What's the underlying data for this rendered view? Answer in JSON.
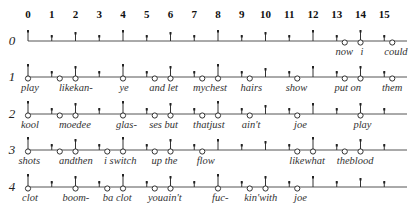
{
  "diagram": {
    "type": "rhythm-grid",
    "beats_per_row": 16,
    "column_labels": [
      "0",
      "1",
      "2",
      "3",
      "4",
      "5",
      "6",
      "7",
      "8",
      "9",
      "10",
      "11",
      "12",
      "13",
      "14",
      "15"
    ],
    "rows": [
      {
        "label": "0",
        "notes": [
          13.33,
          14,
          15.33
        ],
        "lyrics": [
          {
            "text": "now",
            "at": 12.95
          },
          {
            "text": "i",
            "at": 14.0
          },
          {
            "text": "could",
            "at": 15.0
          }
        ]
      },
      {
        "label": "1",
        "notes": [
          0,
          1.33,
          2,
          4,
          5.33,
          6,
          7.33,
          8,
          9.33,
          11.33,
          13.33,
          14,
          15.33
        ],
        "lyrics": [
          {
            "text": "play",
            "at": -0.3
          },
          {
            "text": "likekan-",
            "at": 1.3
          },
          {
            "text": "ye",
            "at": 3.85
          },
          {
            "text": "and let",
            "at": 5.1
          },
          {
            "text": "mychest",
            "at": 6.95
          },
          {
            "text": "hairs",
            "at": 8.95
          },
          {
            "text": "show",
            "at": 10.85
          },
          {
            "text": "put on",
            "at": 12.9
          },
          {
            "text": "them",
            "at": 14.9
          }
        ]
      },
      {
        "label": "2",
        "notes": [
          0,
          1.33,
          2,
          4,
          5.33,
          6,
          7.33,
          8,
          9.33,
          11.33,
          14
        ],
        "lyrics": [
          {
            "text": "kool",
            "at": -0.3
          },
          {
            "text": "moedee",
            "at": 1.3
          },
          {
            "text": "glas-",
            "at": 3.7
          },
          {
            "text": "ses but",
            "at": 5.1
          },
          {
            "text": "thatjust",
            "at": 6.95
          },
          {
            "text": "ain't",
            "at": 9.0
          },
          {
            "text": "joe",
            "at": 11.2
          },
          {
            "text": "play",
            "at": 13.7
          }
        ]
      },
      {
        "label": "3",
        "notes": [
          0,
          1.33,
          2,
          3.33,
          4,
          5.33,
          6,
          7.33,
          11.33,
          12,
          13.33,
          14
        ],
        "lyrics": [
          {
            "text": "shots",
            "at": -0.4
          },
          {
            "text": "andthen",
            "at": 1.3
          },
          {
            "text": "i switch",
            "at": 3.2
          },
          {
            "text": "up the",
            "at": 5.2
          },
          {
            "text": "flow",
            "at": 7.1
          },
          {
            "text": "likewhat",
            "at": 11.0
          },
          {
            "text": "theblood",
            "at": 13.0
          }
        ]
      },
      {
        "label": "4",
        "notes": [
          0,
          2,
          3.33,
          4,
          5.33,
          6,
          8,
          9.33,
          10,
          11.33
        ],
        "lyrics": [
          {
            "text": "clot",
            "at": -0.25
          },
          {
            "text": "boom-",
            "at": 1.45
          },
          {
            "text": "ba clot",
            "at": 3.15
          },
          {
            "text": "youain't",
            "at": 5.05
          },
          {
            "text": "fuc-",
            "at": 7.75
          },
          {
            "text": "kin'with",
            "at": 9.1
          },
          {
            "text": "joe",
            "at": 11.2
          }
        ]
      }
    ]
  },
  "layout": {
    "x0": 28,
    "col_step": 23.75,
    "line_end": 407,
    "header_y": 18,
    "row_baselines": [
      41,
      77,
      114,
      150,
      187
    ],
    "row_label_x": 12
  }
}
